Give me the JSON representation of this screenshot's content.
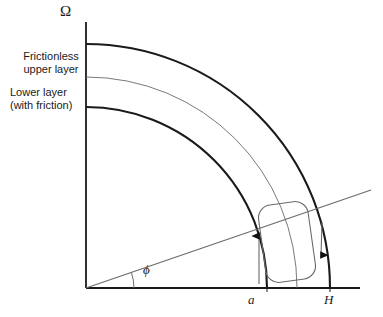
{
  "figure": {
    "title_symbol": "Ω",
    "labels": {
      "omega": "Ω",
      "layer_upper_line1": "Frictionless",
      "layer_upper_line2": "upper layer",
      "layer_lower_line1": "Lower layer",
      "layer_lower_line2": "(with friction)",
      "angle": "ϕ",
      "radius_inner": "a",
      "radius_outer": "H"
    },
    "colors": {
      "stroke_thick": "#1a1a1a",
      "stroke_thin": "#555555",
      "background": "#ffffff",
      "text": "#1a1a1a"
    },
    "geometry": {
      "origin_x": 86,
      "origin_y": 288,
      "axis_top_y": 22,
      "baseline_right_x": 360,
      "arc_inner_radius": 181,
      "arc_middle_radius": 211,
      "arc_outer_radius": 244,
      "arc_inner_axis_y": 107,
      "arc_middle_axis_y": 77,
      "arc_outer_axis_y": 44,
      "arc_inner_base_x": 252,
      "arc_middle_base_x": 293,
      "arc_outer_base_x": 330,
      "phi_angle_degrees": 19,
      "phi_arc_radius": 48,
      "ray_end_x": 371,
      "ray_end_y": 150
    },
    "parcel": {
      "shape": "rounded-rectangle",
      "rotation_degrees": -8,
      "center_x": 287,
      "center_y": 242,
      "width": 50,
      "height": 78,
      "corner_radius": 12
    },
    "flow_arrows": [
      {
        "name": "upward-flow-arrow",
        "direction": "up",
        "x": 259,
        "y_start": 283,
        "y_end": 231
      },
      {
        "name": "downward-flow-arrow",
        "direction": "down",
        "x": 321,
        "y_start": 224,
        "y_end": 259
      }
    ]
  }
}
